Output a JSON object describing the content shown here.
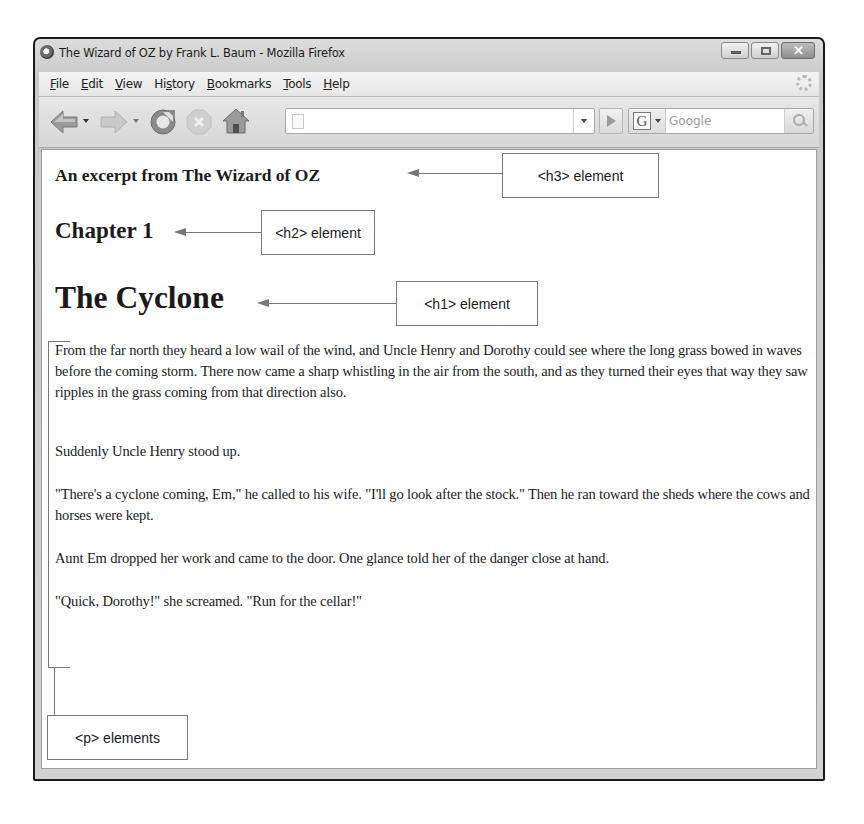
{
  "window": {
    "title": "The Wizard of OZ by Frank L. Baum - Mozilla Firefox",
    "controls": {
      "minimize": "minimize",
      "maximize": "maximize",
      "close": "✕"
    }
  },
  "menubar": {
    "items": [
      {
        "label": "File",
        "accesskey_index": 0
      },
      {
        "label": "Edit",
        "accesskey_index": 0
      },
      {
        "label": "View",
        "accesskey_index": 0
      },
      {
        "label": "History",
        "accesskey_index": 2
      },
      {
        "label": "Bookmarks",
        "accesskey_index": 0
      },
      {
        "label": "Tools",
        "accesskey_index": 0
      },
      {
        "label": "Help",
        "accesskey_index": 0
      }
    ]
  },
  "navbar": {
    "buttons": [
      "back-icon",
      "forward-icon",
      "reload-icon",
      "stop-icon",
      "home-icon"
    ],
    "url": {
      "value": "",
      "placeholder": ""
    },
    "search": {
      "engine_glyph": "G",
      "placeholder": "Google"
    }
  },
  "page": {
    "h3": "An excerpt from The Wizard of OZ",
    "h2": "Chapter 1",
    "h1": "The Cyclone",
    "paragraphs": [
      "From the far north they heard a low wail of the wind, and Uncle Henry and Dorothy could see where the long grass bowed in waves before the coming storm. There now came a sharp whistling in the air from the south, and as they turned their eyes that way they saw ripples in the grass coming from that direction also.",
      "Suddenly Uncle Henry stood up.",
      "\"There's a cyclone coming, Em,\" he called to his wife. \"I'll go look after the stock.\" Then he ran toward the sheds where the cows and horses were kept.",
      "Aunt Em dropped her work and came to the door. One glance told her of the danger close at hand.",
      "\"Quick, Dorothy!\" she screamed. \"Run for the cellar!\""
    ]
  },
  "annotations": {
    "h3": "<h3> element",
    "h2": "<h2> element",
    "h1": "<h1> element",
    "p": "<p> elements"
  },
  "colors": {
    "annotation_line": "#777777",
    "window_frame": "#1a1a1a",
    "chrome_bg": "#d6d6d6"
  }
}
